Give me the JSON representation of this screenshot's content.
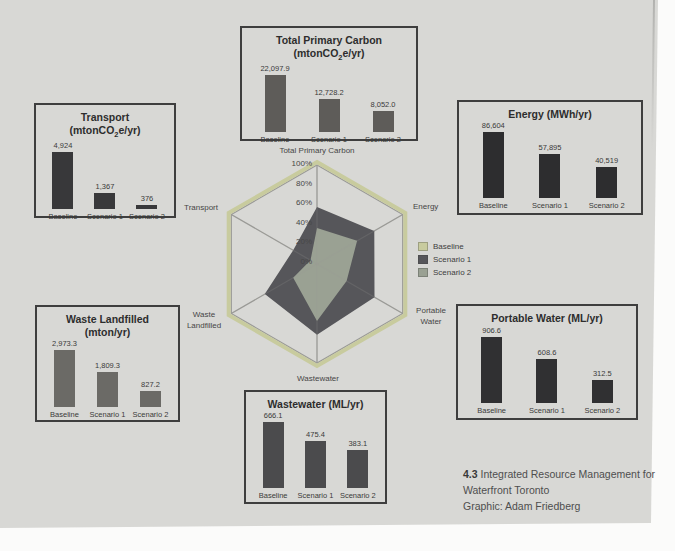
{
  "figure": {
    "page_bg": "#d8d8d5",
    "caption": {
      "number": "4.3",
      "line1": "Integrated Resource Management for",
      "line2": "Waterfront Toronto",
      "credit": "Graphic: Adam Friedberg"
    }
  },
  "legend": {
    "items": [
      {
        "label": "Baseline",
        "color": "#c8cb9e"
      },
      {
        "label": "Scenario 1",
        "color": "#56565a"
      },
      {
        "label": "Scenario 2",
        "color": "#9aa193"
      }
    ]
  },
  "chart_data": [
    {
      "type": "bar",
      "id": "total-primary-carbon",
      "title": "Total Primary Carbon",
      "unit": "(mtonCO2e/yr)",
      "categories": [
        "Baseline",
        "Scenario 1",
        "Scenario 2"
      ],
      "values": [
        22097.9,
        12728.2,
        8052.0
      ],
      "value_labels": [
        "22,097.9",
        "12,728.2",
        "8,052.0"
      ],
      "bar_color": "#5e5c59",
      "ylim": [
        0,
        22097.9
      ]
    },
    {
      "type": "bar",
      "id": "transport",
      "title": "Transport",
      "unit": "(mtonCO2e/yr)",
      "categories": [
        "Baseline",
        "Scenario 1",
        "Scenario 2"
      ],
      "values": [
        4924,
        1367,
        376
      ],
      "value_labels": [
        "4,924",
        "1,367",
        "376"
      ],
      "bar_color": "#38383a",
      "ylim": [
        0,
        4924
      ]
    },
    {
      "type": "bar",
      "id": "energy",
      "title": "Energy (MWh/yr)",
      "unit": "",
      "categories": [
        "Baseline",
        "Scenario 1",
        "Scenario 2"
      ],
      "values": [
        86604,
        57895,
        40519
      ],
      "value_labels": [
        "86,604",
        "57,895",
        "40,519"
      ],
      "bar_color": "#2d2d2f",
      "ylim": [
        0,
        86604
      ]
    },
    {
      "type": "bar",
      "id": "waste-landfilled",
      "title": "Waste Landfilled",
      "unit": "(mton/yr)",
      "categories": [
        "Baseline",
        "Scenario 1",
        "Scenario 2"
      ],
      "values": [
        2973.3,
        1809.3,
        827.2
      ],
      "value_labels": [
        "2,973.3",
        "1,809.3",
        "827.2"
      ],
      "bar_color": "#6b6a66",
      "ylim": [
        0,
        2973.3
      ]
    },
    {
      "type": "bar",
      "id": "wastewater",
      "title": "Wastewater (ML/yr)",
      "unit": "",
      "categories": [
        "Baseline",
        "Scenario 1",
        "Scenario 2"
      ],
      "values": [
        666.1,
        475.4,
        383.1
      ],
      "value_labels": [
        "666.1",
        "475.4",
        "383.1"
      ],
      "bar_color": "#4b4b4d",
      "ylim": [
        0,
        666.1
      ]
    },
    {
      "type": "bar",
      "id": "portable-water",
      "title": "Portable Water (ML/yr)",
      "unit": "",
      "categories": [
        "Baseline",
        "Scenario 1",
        "Scenario 2"
      ],
      "values": [
        906.6,
        608.6,
        312.5
      ],
      "value_labels": [
        "906.6",
        "608.6",
        "312.5"
      ],
      "bar_color": "#303032",
      "ylim": [
        0,
        906.6
      ]
    },
    {
      "type": "radar",
      "id": "scenario-comparison-radar",
      "axes": [
        "Total Primary Carbon",
        "Energy",
        "Portable Water",
        "Wastewater",
        "Waste Landfilled",
        "Transport"
      ],
      "tick_labels": [
        "100%",
        "80%",
        "60%",
        "40%",
        "20%",
        "0%"
      ],
      "series": [
        {
          "name": "Baseline",
          "color": "#c8cb9e",
          "values_pct": [
            100,
            100,
            100,
            100,
            100,
            100
          ]
        },
        {
          "name": "Scenario 1",
          "color": "#56565a",
          "values_pct": [
            57.6,
            66.8,
            67.1,
            71.4,
            60.9,
            27.8
          ]
        },
        {
          "name": "Scenario 2",
          "color": "#9aa193",
          "values_pct": [
            36.4,
            46.8,
            34.5,
            57.5,
            27.8,
            7.6
          ]
        }
      ]
    }
  ]
}
